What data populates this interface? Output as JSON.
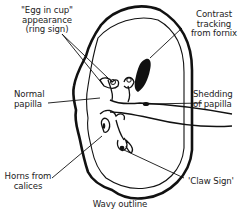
{
  "diagram": {
    "labels": {
      "egg_in_cup": {
        "line1": "\"Egg in cup\"",
        "line2": "appearance",
        "line3": "(ring sign)"
      },
      "contrast_tracking": {
        "line1": "Contrast",
        "line2": "tracking",
        "line3": "from fornix"
      },
      "normal_papilla": {
        "line1": "Normal",
        "line2": "papilla"
      },
      "shedding": {
        "line1": "Shedding",
        "line2": "of papilla"
      },
      "horns": {
        "line1": "Horns from",
        "line2": "calices"
      },
      "claw_sign": {
        "line1": "'Claw Sign'"
      },
      "wavy_outline": {
        "line1": "Wavy outline"
      }
    },
    "colors": {
      "ink": "#111111",
      "background": "#ffffff"
    }
  }
}
